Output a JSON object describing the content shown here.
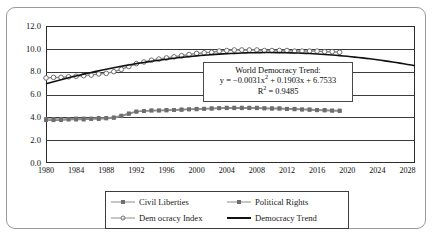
{
  "chart_data": {
    "type": "line",
    "title": "",
    "xlabel": "",
    "ylabel": "",
    "xlim": [
      1980,
      2029
    ],
    "ylim": [
      0,
      12
    ],
    "y_ticks": [
      "0.0",
      "2.0",
      "4.0",
      "6.0",
      "8.0",
      "10.0",
      "12.0"
    ],
    "x_ticks": [
      "1980",
      "1984",
      "1988",
      "1992",
      "1996",
      "2000",
      "2004",
      "2008",
      "2012",
      "2016",
      "2020",
      "2024",
      "2028"
    ],
    "grid": "horizontal",
    "legend_position": "bottom",
    "x": [
      1980,
      1981,
      1982,
      1983,
      1984,
      1985,
      1986,
      1987,
      1988,
      1989,
      1990,
      1991,
      1992,
      1993,
      1994,
      1995,
      1996,
      1997,
      1998,
      1999,
      2000,
      2001,
      2002,
      2003,
      2004,
      2005,
      2006,
      2007,
      2008,
      2009,
      2010,
      2011,
      2012,
      2013,
      2014,
      2015,
      2016,
      2017,
      2018,
      2019
    ],
    "series": [
      {
        "name": "Democracy Index",
        "marker": "circle",
        "values": [
          7.45,
          7.5,
          7.5,
          7.55,
          7.6,
          7.65,
          7.7,
          7.8,
          7.85,
          8.0,
          8.2,
          8.45,
          8.7,
          8.85,
          9.0,
          9.1,
          9.2,
          9.3,
          9.4,
          9.5,
          9.6,
          9.65,
          9.7,
          9.8,
          9.85,
          9.9,
          9.9,
          9.9,
          9.9,
          9.85,
          9.85,
          9.85,
          9.85,
          9.8,
          9.8,
          9.8,
          9.8,
          9.75,
          9.75,
          9.7
        ]
      },
      {
        "name": "Political Rights",
        "marker": "square",
        "values": [
          3.75,
          3.75,
          3.75,
          3.8,
          3.8,
          3.8,
          3.85,
          3.85,
          3.9,
          3.95,
          4.1,
          4.3,
          4.5,
          4.55,
          4.6,
          4.6,
          4.65,
          4.65,
          4.7,
          4.7,
          4.75,
          4.75,
          4.8,
          4.8,
          4.85,
          4.85,
          4.85,
          4.85,
          4.85,
          4.8,
          4.8,
          4.8,
          4.75,
          4.75,
          4.7,
          4.7,
          4.65,
          4.65,
          4.6,
          4.6
        ]
      },
      {
        "name": "Civil Liberties",
        "marker": "square",
        "values": [
          3.85,
          3.85,
          3.85,
          3.85,
          3.9,
          3.9,
          3.9,
          3.95,
          3.95,
          4.0,
          4.15,
          4.35,
          4.5,
          4.55,
          4.6,
          4.6,
          4.6,
          4.65,
          4.65,
          4.7,
          4.7,
          4.75,
          4.75,
          4.8,
          4.8,
          4.8,
          4.8,
          4.8,
          4.8,
          4.78,
          4.75,
          4.75,
          4.72,
          4.7,
          4.68,
          4.65,
          4.62,
          4.6,
          4.58,
          4.55
        ]
      }
    ],
    "trend": {
      "name": "Democracy Trend",
      "equation_a": -0.0031,
      "equation_b": 0.1903,
      "equation_c": 6.7533,
      "r_squared": 0.9485,
      "x_start": 1980,
      "x_end": 2029
    }
  },
  "annotation": {
    "title": "World Democracy Trend:",
    "equation_prefix": "y = −0.0031x",
    "equation_exp": "2",
    "equation_suffix": " + 0.1903x + 6.7533",
    "r2_prefix": "R",
    "r2_exp": "2",
    "r2_suffix": " = 0.9485"
  },
  "legend": {
    "items": [
      {
        "label": "Civil Liberties",
        "key": "square-marker-line"
      },
      {
        "label": "Political Rights",
        "key": "square-marker-line"
      },
      {
        "label": "Dem ocracy Index",
        "key": "circle-marker-line"
      },
      {
        "label": "Democracy Trend",
        "key": "solid-line"
      }
    ]
  },
  "colors": {
    "trend_line": "#111111",
    "series_line": "#8d8d8d",
    "marker": "#6e6e6e",
    "grid": "#3a3a3a",
    "frame": "#2b2b2b",
    "figure_border": "#9a9a9a"
  }
}
